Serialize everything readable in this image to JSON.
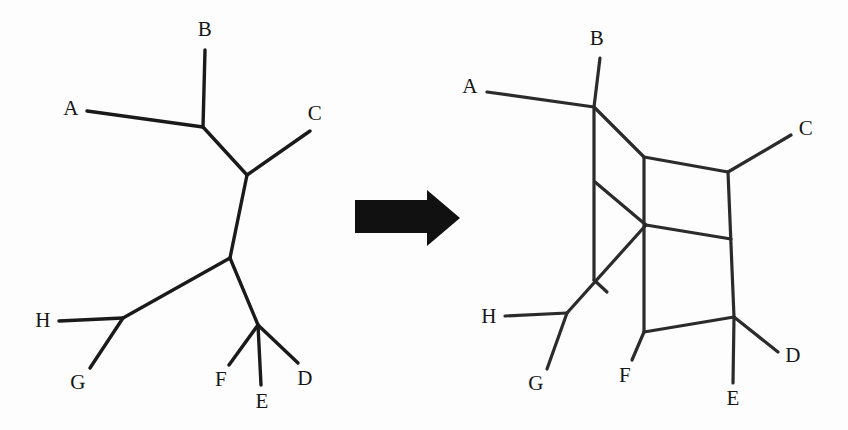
{
  "figure": {
    "background_color": "#fdfdfd",
    "line_color": "#1a1a1a",
    "label_color": "#161616",
    "arrow_color": "#111111"
  },
  "arrow": {
    "name": "transformation-arrow",
    "direction": "right",
    "body": {
      "x": 355,
      "y": 200,
      "width": 74,
      "height": 33
    },
    "head": {
      "x": 427,
      "y": 190,
      "width": 33,
      "height": 56
    }
  },
  "tree": {
    "name": "unrooted-phylogenetic-tree",
    "caption": "",
    "taxa": [
      {
        "id": "A",
        "label": "A",
        "label_x": 71,
        "label_y": 110,
        "tip_x": 87,
        "tip_y": 111
      },
      {
        "id": "B",
        "label": "B",
        "label_x": 205,
        "label_y": 31,
        "tip_x": 205,
        "tip_y": 50
      },
      {
        "id": "C",
        "label": "C",
        "label_x": 315,
        "label_y": 115,
        "tip_x": 310,
        "tip_y": 131
      },
      {
        "id": "D",
        "label": "D",
        "label_x": 305,
        "label_y": 380,
        "tip_x": 298,
        "tip_y": 363
      },
      {
        "id": "E",
        "label": "E",
        "label_x": 262,
        "label_y": 403,
        "tip_x": 261,
        "tip_y": 385
      },
      {
        "id": "F",
        "label": "F",
        "label_x": 221,
        "label_y": 381,
        "tip_x": 229,
        "tip_y": 365
      },
      {
        "id": "G",
        "label": "G",
        "label_x": 78,
        "label_y": 384,
        "tip_x": 90,
        "tip_y": 368
      },
      {
        "id": "H",
        "label": "H",
        "label_x": 43,
        "label_y": 322,
        "tip_x": 59,
        "tip_y": 321
      }
    ],
    "internal_nodes": [
      {
        "id": "n1",
        "x": 203,
        "y": 127
      },
      {
        "id": "n2",
        "x": 247,
        "y": 175
      },
      {
        "id": "n3",
        "x": 230,
        "y": 258
      },
      {
        "id": "n4",
        "x": 123,
        "y": 318
      },
      {
        "id": "n5",
        "x": 258,
        "y": 325
      }
    ],
    "edges": [
      {
        "from": "A",
        "to": "n1"
      },
      {
        "from": "B",
        "to": "n1"
      },
      {
        "from": "n1",
        "to": "n2"
      },
      {
        "from": "C",
        "to": "n2"
      },
      {
        "from": "n2",
        "to": "n3"
      },
      {
        "from": "n3",
        "to": "n4"
      },
      {
        "from": "H",
        "to": "n4"
      },
      {
        "from": "G",
        "to": "n4"
      },
      {
        "from": "n3",
        "to": "n5"
      },
      {
        "from": "F",
        "to": "n5"
      },
      {
        "from": "E",
        "to": "n5"
      },
      {
        "from": "D",
        "to": "n5"
      }
    ]
  },
  "network": {
    "name": "split-network",
    "caption": "",
    "taxa": [
      {
        "id": "A",
        "label": "A",
        "label_x": 470,
        "label_y": 88,
        "tip_x": 487,
        "tip_y": 92
      },
      {
        "id": "B",
        "label": "B",
        "label_x": 597,
        "label_y": 40,
        "tip_x": 600,
        "tip_y": 58
      },
      {
        "id": "C",
        "label": "C",
        "label_x": 806,
        "label_y": 130,
        "tip_x": 791,
        "tip_y": 135
      },
      {
        "id": "D",
        "label": "D",
        "label_x": 793,
        "label_y": 357,
        "tip_x": 778,
        "tip_y": 352
      },
      {
        "id": "E",
        "label": "E",
        "label_x": 733,
        "label_y": 400,
        "tip_x": 733,
        "tip_y": 383
      },
      {
        "id": "F",
        "label": "F",
        "label_x": 625,
        "label_y": 377,
        "tip_x": 632,
        "tip_y": 360
      },
      {
        "id": "G",
        "label": "G",
        "label_x": 536,
        "label_y": 385,
        "tip_x": 547,
        "tip_y": 369
      },
      {
        "id": "H",
        "label": "H",
        "label_x": 489,
        "label_y": 318,
        "tip_x": 505,
        "tip_y": 316
      }
    ],
    "internal_nodes": [
      {
        "id": "v1",
        "x": 594,
        "y": 107
      },
      {
        "id": "v2",
        "x": 594,
        "y": 280
      },
      {
        "id": "v3",
        "x": 644,
        "y": 157
      },
      {
        "id": "v4",
        "x": 644,
        "y": 332
      },
      {
        "id": "v5",
        "x": 728,
        "y": 172
      },
      {
        "id": "v6",
        "x": 734,
        "y": 317
      },
      {
        "id": "v7",
        "x": 595,
        "y": 182
      },
      {
        "id": "v8",
        "x": 646,
        "y": 225
      },
      {
        "id": "v9",
        "x": 731,
        "y": 239
      },
      {
        "id": "v10",
        "x": 607,
        "y": 292
      },
      {
        "id": "v11",
        "x": 567,
        "y": 313
      }
    ],
    "edges": [
      {
        "from": "A",
        "to": "v1",
        "note": "pendant-A"
      },
      {
        "from": "B",
        "to": "v1",
        "note": "pendant-B-upper"
      },
      {
        "from": "v1",
        "to": "v2",
        "note": "vertical-left-long"
      },
      {
        "from": "v1",
        "to": "v3",
        "note": "diagonal-top"
      },
      {
        "from": "v3",
        "to": "v5",
        "note": "top-box-top-edge"
      },
      {
        "from": "v5",
        "to": "C",
        "note": "pendant-C"
      },
      {
        "from": "v3",
        "to": "v4",
        "note": "vertical-mid-long"
      },
      {
        "from": "v5",
        "to": "v6",
        "note": "vertical-right-long"
      },
      {
        "from": "v7",
        "to": "v8",
        "note": "diagonal-middle"
      },
      {
        "from": "v8",
        "to": "v9",
        "note": "mid-box-bottom-edge"
      },
      {
        "from": "v2",
        "to": "v10",
        "note": "short-diagonal-lower"
      },
      {
        "from": "v11",
        "to": "v8",
        "note": "crossing-diagonal"
      },
      {
        "from": "v11",
        "to": "H",
        "note": "pendant-H"
      },
      {
        "from": "v11",
        "to": "G",
        "note": "pendant-G"
      },
      {
        "from": "v4",
        "to": "v6",
        "note": "bottom-box-edge"
      },
      {
        "from": "v4",
        "to": "F",
        "note": "pendant-F"
      },
      {
        "from": "v6",
        "to": "E",
        "note": "pendant-E"
      },
      {
        "from": "v6",
        "to": "D",
        "note": "pendant-D"
      }
    ]
  }
}
